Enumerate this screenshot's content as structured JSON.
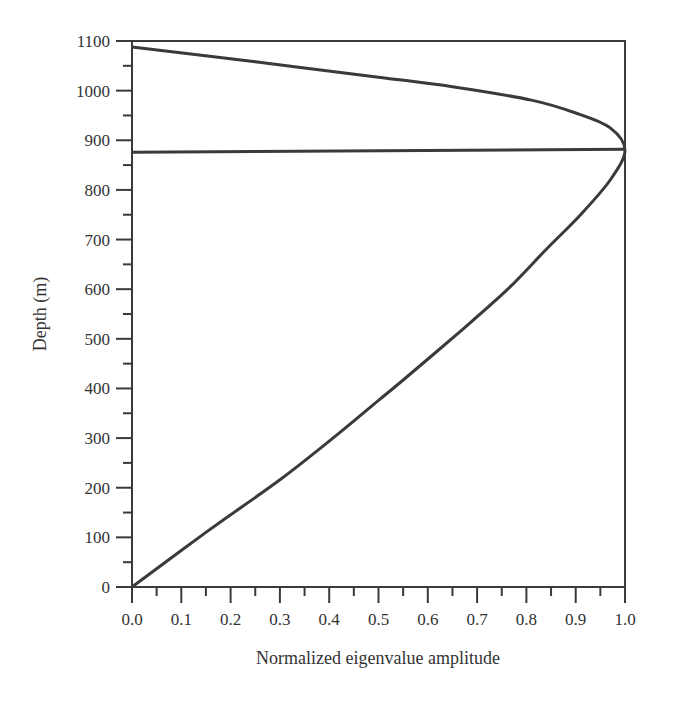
{
  "chart_data": {
    "type": "line",
    "title": "",
    "xlabel": "Normalized eigenvalue amplitude",
    "ylabel": "Depth (m)",
    "xlim": [
      0.0,
      1.0
    ],
    "ylim": [
      0,
      1100
    ],
    "x_ticks": [
      "0.0",
      "0.1",
      "0.2",
      "0.3",
      "0.4",
      "0.5",
      "0.6",
      "0.7",
      "0.8",
      "0.9",
      "1.0"
    ],
    "y_ticks": [
      "0",
      "100",
      "200",
      "300",
      "400",
      "500",
      "600",
      "700",
      "800",
      "900",
      "1000",
      "1100"
    ],
    "grid": false,
    "legend": null,
    "series": [
      {
        "name": "eigenfunction",
        "points": [
          {
            "x": 0.0,
            "y": 0
          },
          {
            "x": 0.15,
            "y": 110
          },
          {
            "x": 0.3,
            "y": 216
          },
          {
            "x": 0.42,
            "y": 310
          },
          {
            "x": 0.5,
            "y": 376
          },
          {
            "x": 0.55,
            "y": 417
          },
          {
            "x": 0.66,
            "y": 510
          },
          {
            "x": 0.76,
            "y": 598
          },
          {
            "x": 0.84,
            "y": 680
          },
          {
            "x": 0.91,
            "y": 750
          },
          {
            "x": 0.97,
            "y": 820
          },
          {
            "x": 1.0,
            "y": 880
          },
          {
            "x": 0.97,
            "y": 925
          },
          {
            "x": 0.9,
            "y": 955
          },
          {
            "x": 0.81,
            "y": 981
          },
          {
            "x": 0.65,
            "y": 1008
          },
          {
            "x": 0.5,
            "y": 1027
          },
          {
            "x": 0.25,
            "y": 1058
          },
          {
            "x": 0.0,
            "y": 1088
          }
        ]
      },
      {
        "name": "interface-line",
        "points": [
          {
            "x": 0.0,
            "y": 876
          },
          {
            "x": 1.0,
            "y": 882
          }
        ]
      }
    ]
  },
  "colors": {
    "line": "#3a3a3a",
    "axis": "#3a3a3a",
    "text": "#333333",
    "background": "#ffffff"
  }
}
